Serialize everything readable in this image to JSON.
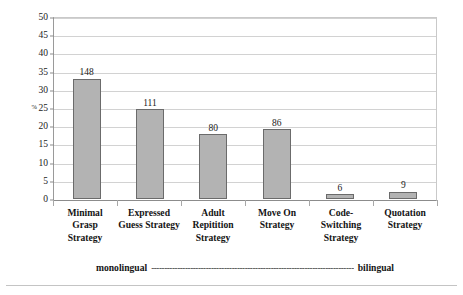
{
  "chart_data": {
    "type": "bar",
    "title": "",
    "subtitle": "",
    "xlabel": "",
    "ylabel": "%",
    "categories": [
      "Minimal Grasp Strategy",
      "Expressed Guess Strategy",
      "Adult Repitition Strategy",
      "Move On Strategy",
      "Code-Switching Strategy",
      "Quotation Strategy"
    ],
    "category_lines": [
      [
        "Minimal Grasp",
        "Strategy"
      ],
      [
        "Expressed",
        "Guess Strategy"
      ],
      [
        "Adult",
        "Repitition",
        "Strategy"
      ],
      [
        "Move On",
        "Strategy"
      ],
      [
        "Code-",
        "Switching",
        "Strategy"
      ],
      [
        "Quotation",
        "Strategy"
      ]
    ],
    "values": [
      33.4,
      25.0,
      18.0,
      19.4,
      1.35,
      2.0
    ],
    "data_labels": [
      "148",
      "111",
      "80",
      "86",
      "6",
      "9"
    ],
    "counts": [
      148,
      111,
      80,
      86,
      6,
      9
    ],
    "ylim": [
      0,
      50
    ],
    "ytick_step": 5,
    "ytick_labels": [
      "50",
      "45",
      "40",
      "35",
      "30",
      "25",
      "20",
      "15",
      "10",
      "5",
      "0"
    ],
    "percent_symbol": "%",
    "percent_at_tick": "25",
    "grid": true,
    "legend": null,
    "annotations": {
      "left_pole": "monolingual",
      "dash_line": "------------------------------------------------------------------------------",
      "right_pole": "bilingual"
    },
    "colors": {
      "bar_fill": "#b3b3b3",
      "bar_border": "#6b6b6b",
      "gridline": "#d2d2d2",
      "axis": "#8c8c8c",
      "text": "#1a1a1a",
      "background": "#ffffff"
    }
  }
}
